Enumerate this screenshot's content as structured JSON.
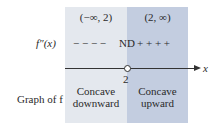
{
  "intervals": [
    {
      "label": "(−∞, 2)",
      "concavity_line1": "Concave",
      "concavity_line2": "downward",
      "sign": "− − − −"
    },
    {
      "label": "(2, ∞)",
      "concavity_line1": "Concave",
      "concavity_line2": "upward",
      "sign": "+ + + +"
    }
  ],
  "row_labels": {
    "second_derivative": "f″(x)",
    "graph": "Graph of f"
  },
  "critical_value": {
    "x": "2",
    "status": "ND"
  },
  "axis_label": "x",
  "colors": {
    "left_panel": "#e4e8ee",
    "right_panel": "#c3cde0"
  }
}
